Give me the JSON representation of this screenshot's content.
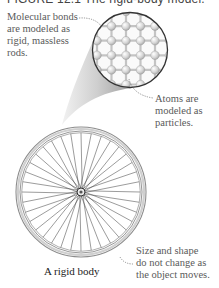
{
  "figure": {
    "title": "FIGURE 12.1 The rigid-body model."
  },
  "annotations": {
    "molecular_bonds": {
      "lines": [
        "Molecular bonds",
        "are modeled as",
        "rigid, massless",
        "rods."
      ]
    },
    "atoms": {
      "lines": [
        "Atoms are",
        "modeled as",
        "particles."
      ]
    },
    "size_shape": {
      "lines": [
        "Size and shape",
        "do not change as",
        "the object moves."
      ]
    }
  },
  "object_label": "A rigid body",
  "colors": {
    "text_annotation": "#5a5a5a",
    "text_label": "#222222",
    "rim": "#8a8a8a",
    "spoke": "#555555",
    "atom": "#d8d8d8",
    "bond": "#c8c8c8",
    "cone": "#bdbdbd"
  },
  "wheel": {
    "spoke_count": 36
  },
  "lattice": {
    "rows": 6,
    "cols": 6
  }
}
